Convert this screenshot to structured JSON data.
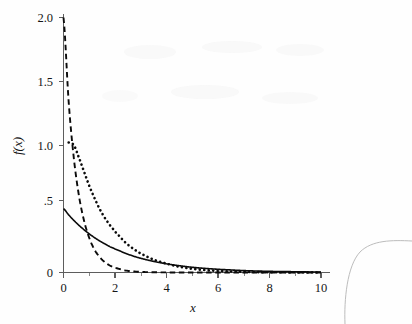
{
  "figure": {
    "background_color": "#fefefe",
    "ink_color": "#0b0b0b",
    "axis_color": "#5d5d5d",
    "artifact_color": "#b4b4b4"
  },
  "labels": {
    "y_axis_title": "f(x)",
    "x_axis_title": "x",
    "y_ticks": [
      "0",
      ".5",
      "1.0",
      "1.5",
      "2.0"
    ],
    "x_ticks": [
      "0",
      "2",
      "4",
      "6",
      "8",
      "10"
    ]
  },
  "chart_data": {
    "type": "line",
    "title": "",
    "xlabel": "x",
    "ylabel": "f(x)",
    "xlim": [
      0,
      10
    ],
    "ylim": [
      0,
      2.0
    ],
    "xticks": [
      0,
      2,
      4,
      6,
      8,
      10
    ],
    "yticks": [
      0,
      0.5,
      1.0,
      1.5,
      2.0
    ],
    "ytick_labels": [
      "0",
      ".5",
      "1.0",
      "1.5",
      "2.0"
    ],
    "grid": false,
    "legend": "none",
    "x": [
      0,
      0.2,
      0.4,
      0.6,
      0.8,
      1.0,
      1.2,
      1.4,
      1.6,
      1.8,
      2.0,
      2.4,
      2.8,
      3.2,
      3.6,
      4.0,
      4.5,
      5.0,
      5.5,
      6.0,
      7.0,
      8.0,
      9.0,
      10.0
    ],
    "series": [
      {
        "name": "dashed-curve",
        "style": "dashed",
        "description": "exponential density with rate 2, f(x) = 2*exp(-2x)",
        "values": [
          2.0,
          1.341,
          0.899,
          0.602,
          0.404,
          0.271,
          0.181,
          0.122,
          0.082,
          0.055,
          0.037,
          0.016,
          0.007,
          0.003,
          0.0015,
          0.0007,
          0.0002,
          0.0001,
          0.0,
          0.0,
          0.0,
          0.0,
          0.0,
          0.0
        ]
      },
      {
        "name": "dotted-curve",
        "style": "dotted",
        "description": "gamma-like density peaking near 1.05 at small x then decaying",
        "values": [
          0.0,
          1.02,
          1.0,
          0.9,
          0.79,
          0.68,
          0.585,
          0.5,
          0.43,
          0.372,
          0.32,
          0.236,
          0.174,
          0.128,
          0.094,
          0.069,
          0.045,
          0.029,
          0.019,
          0.012,
          0.005,
          0.002,
          0.001,
          0.0005
        ]
      },
      {
        "name": "solid-curve",
        "style": "solid",
        "description": "exponential density with rate 0.5, f(x) = 0.5*exp(-0.5x)",
        "values": [
          0.5,
          0.452,
          0.409,
          0.37,
          0.335,
          0.303,
          0.274,
          0.248,
          0.225,
          0.203,
          0.184,
          0.151,
          0.123,
          0.101,
          0.083,
          0.068,
          0.053,
          0.041,
          0.032,
          0.025,
          0.015,
          0.009,
          0.006,
          0.003
        ]
      }
    ]
  }
}
